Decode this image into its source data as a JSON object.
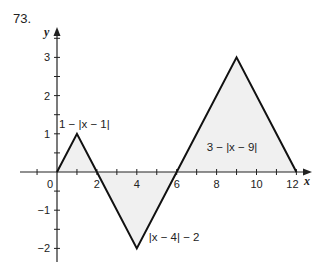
{
  "problem_number": "73.",
  "chart_data": {
    "type": "line",
    "title": "",
    "xlabel": "x",
    "ylabel": "y",
    "xlim": [
      -1,
      13
    ],
    "ylim": [
      -2.3,
      3.5
    ],
    "x_ticks": [
      2,
      4,
      6,
      8,
      10,
      12
    ],
    "x_minor_ticks": [
      -1,
      1,
      3,
      5,
      7,
      9,
      11
    ],
    "y_ticks": [
      -2,
      -1,
      1,
      2,
      3
    ],
    "origin_label": "0",
    "grid": false,
    "series": [
      {
        "name": "1 − |x − 1|",
        "x": [
          0,
          1,
          2
        ],
        "y": [
          0,
          1,
          0
        ]
      },
      {
        "name": "|x − 4| − 2",
        "x": [
          2,
          4,
          6
        ],
        "y": [
          0,
          -2,
          0
        ]
      },
      {
        "name": "3 − |x − 9|",
        "x": [
          6,
          9,
          12
        ],
        "y": [
          0,
          3,
          0
        ]
      }
    ],
    "annotations": [
      {
        "text": "1 − |x − 1|",
        "x": 0.1,
        "y": 1.15
      },
      {
        "text": "|x − 4| − 2",
        "x": 4.6,
        "y": -1.8
      },
      {
        "text": "3 − |x − 9|",
        "x": 7.5,
        "y": 0.55
      }
    ],
    "shaded_regions": "areas between curves and x-axis lightly stippled"
  }
}
